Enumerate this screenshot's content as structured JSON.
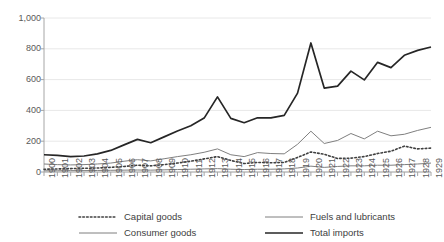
{
  "chart_data": {
    "type": "line",
    "title": "",
    "xlabel": "",
    "ylabel": "",
    "ylim": [
      0,
      1000
    ],
    "yticks": [
      0,
      200,
      400,
      600,
      800,
      1000
    ],
    "ytick_labels": [
      "0",
      "200",
      "400",
      "600",
      "800",
      "1,000"
    ],
    "grid": true,
    "legend_position": "bottom",
    "categories": [
      "1900",
      "1901",
      "1902",
      "1903",
      "1904",
      "1905",
      "1906",
      "1907",
      "1908",
      "1909",
      "1910",
      "1911",
      "1912",
      "1913",
      "1914",
      "1915",
      "1916",
      "1917",
      "1918",
      "1919",
      "1920",
      "1921",
      "1922",
      "1923",
      "1924",
      "1925",
      "1926",
      "1927",
      "1928",
      "1929"
    ],
    "series": [
      {
        "name": "Capital goods",
        "style": "dotted",
        "color": "#404040",
        "values": [
          18,
          20,
          22,
          24,
          26,
          30,
          36,
          44,
          40,
          48,
          58,
          70,
          85,
          100,
          75,
          55,
          62,
          60,
          62,
          95,
          130,
          115,
          88,
          90,
          100,
          120,
          135,
          168,
          150,
          155
        ]
      },
      {
        "name": "Consumer goods",
        "style": "thin",
        "color": "#7f7f7f",
        "values": [
          52,
          48,
          46,
          48,
          52,
          58,
          70,
          80,
          72,
          86,
          100,
          112,
          128,
          150,
          112,
          100,
          126,
          120,
          118,
          180,
          265,
          185,
          205,
          250,
          215,
          265,
          235,
          245,
          270,
          290
        ]
      },
      {
        "name": "Fuels and lubricants",
        "style": "thin-dark",
        "color": "#7f7f7f",
        "values": [
          8,
          8,
          9,
          9,
          10,
          11,
          12,
          13,
          12,
          14,
          16,
          18,
          20,
          22,
          18,
          16,
          18,
          18,
          20,
          26,
          38,
          30,
          36,
          40,
          40,
          44,
          44,
          48,
          52,
          58
        ]
      },
      {
        "name": "Total imports",
        "style": "thick",
        "color": "#262626",
        "values": [
          112,
          108,
          100,
          104,
          118,
          140,
          176,
          212,
          190,
          228,
          266,
          300,
          350,
          488,
          348,
          320,
          352,
          352,
          368,
          512,
          838,
          545,
          558,
          655,
          598,
          712,
          678,
          758,
          790,
          812
        ]
      }
    ]
  },
  "legend": {
    "items": [
      {
        "label": "Capital goods",
        "style": "dotted"
      },
      {
        "label": "Fuels and lubricants",
        "style": "thin-dark"
      },
      {
        "label": "Consumer goods",
        "style": "thin"
      },
      {
        "label": "Total imports",
        "style": "thick"
      }
    ]
  },
  "colors": {
    "grid": "#e8e8e8",
    "axis": "#a6a6a6",
    "tick_text": "#595959",
    "legend_text": "#404040",
    "capital_goods": "#404040",
    "consumer_goods": "#7f7f7f",
    "fuels_and_lubricants": "#7f7f7f",
    "total_imports": "#262626"
  }
}
